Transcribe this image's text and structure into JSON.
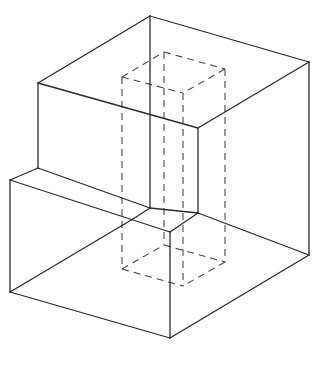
{
  "diagram": {
    "type": "isometric-solid-with-hidden-prism",
    "colors": {
      "background": "#ffffff",
      "solid_edges": "#2b2b2b",
      "hidden_edges": "#4a4a4a"
    },
    "solid_edges": [
      {
        "id": "top-back-left",
        "x1": 38,
        "y1": 83,
        "x2": 150,
        "y2": 16
      },
      {
        "id": "top-back-right",
        "x1": 150,
        "y1": 16,
        "x2": 309,
        "y2": 62
      },
      {
        "id": "top-front-right",
        "x1": 309,
        "y1": 62,
        "x2": 198,
        "y2": 128
      },
      {
        "id": "top-front-left",
        "x1": 38,
        "y1": 83,
        "x2": 198,
        "y2": 128
      },
      {
        "id": "back-vertical",
        "x1": 150,
        "y1": 16,
        "x2": 150,
        "y2": 208
      },
      {
        "id": "upper-left-vertical",
        "x1": 38,
        "y1": 83,
        "x2": 38,
        "y2": 168
      },
      {
        "id": "inner-front-vertical",
        "x1": 198,
        "y1": 128,
        "x2": 198,
        "y2": 213
      },
      {
        "id": "right-vertical",
        "x1": 309,
        "y1": 62,
        "x2": 309,
        "y2": 255
      },
      {
        "id": "step-left-edge",
        "x1": 38,
        "y1": 168,
        "x2": 10,
        "y2": 180
      },
      {
        "id": "step-back-edge",
        "x1": 38,
        "y1": 168,
        "x2": 150,
        "y2": 208
      },
      {
        "id": "step-inner-edge",
        "x1": 150,
        "y1": 208,
        "x2": 198,
        "y2": 213
      },
      {
        "id": "step-front-back-edge",
        "x1": 150,
        "y1": 208,
        "x2": 133,
        "y2": 219
      },
      {
        "id": "step-front-edge",
        "x1": 10,
        "y1": 180,
        "x2": 170,
        "y2": 232
      },
      {
        "id": "step-front-right",
        "x1": 198,
        "y1": 213,
        "x2": 170,
        "y2": 232
      },
      {
        "id": "step-side-edge",
        "x1": 198,
        "y1": 213,
        "x2": 309,
        "y2": 255
      },
      {
        "id": "lower-left-vertical",
        "x1": 10,
        "y1": 180,
        "x2": 10,
        "y2": 292
      },
      {
        "id": "lower-front-vertical",
        "x1": 170,
        "y1": 232,
        "x2": 170,
        "y2": 338
      },
      {
        "id": "bottom-front-left",
        "x1": 10,
        "y1": 292,
        "x2": 170,
        "y2": 338
      },
      {
        "id": "bottom-front-right",
        "x1": 170,
        "y1": 338,
        "x2": 309,
        "y2": 255
      },
      {
        "id": "bottom-back-left-visible",
        "x1": 10,
        "y1": 292,
        "x2": 133,
        "y2": 219
      }
    ],
    "hidden_edges": [
      {
        "id": "prism-top-back-left",
        "x1": 122,
        "y1": 77,
        "x2": 164,
        "y2": 52
      },
      {
        "id": "prism-top-back-right",
        "x1": 164,
        "y1": 52,
        "x2": 225,
        "y2": 69
      },
      {
        "id": "prism-top-front-right",
        "x1": 225,
        "y1": 69,
        "x2": 183,
        "y2": 93
      },
      {
        "id": "prism-top-front-left",
        "x1": 122,
        "y1": 77,
        "x2": 183,
        "y2": 93
      },
      {
        "id": "prism-vert-left",
        "x1": 122,
        "y1": 77,
        "x2": 122,
        "y2": 269
      },
      {
        "id": "prism-vert-back",
        "x1": 164,
        "y1": 52,
        "x2": 164,
        "y2": 245
      },
      {
        "id": "prism-vert-right",
        "x1": 225,
        "y1": 69,
        "x2": 225,
        "y2": 262
      },
      {
        "id": "prism-vert-front",
        "x1": 183,
        "y1": 93,
        "x2": 183,
        "y2": 286
      },
      {
        "id": "prism-bot-back-left",
        "x1": 122,
        "y1": 269,
        "x2": 164,
        "y2": 245
      },
      {
        "id": "prism-bot-back-right",
        "x1": 164,
        "y1": 245,
        "x2": 225,
        "y2": 262
      },
      {
        "id": "prism-bot-front-right",
        "x1": 225,
        "y1": 262,
        "x2": 183,
        "y2": 286
      },
      {
        "id": "prism-bot-front-left",
        "x1": 122,
        "y1": 269,
        "x2": 183,
        "y2": 286
      }
    ]
  }
}
